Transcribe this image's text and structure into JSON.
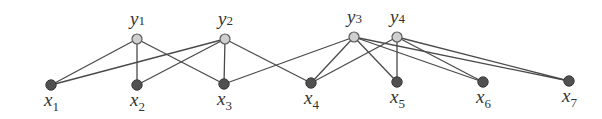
{
  "diagram": {
    "type": "bipartite-graph",
    "top_nodes": [
      {
        "id": "y1",
        "base": "y",
        "sub": "1",
        "x": 137,
        "y": 39
      },
      {
        "id": "y2",
        "base": "y",
        "sub": "2",
        "x": 225,
        "y": 39
      },
      {
        "id": "y3",
        "base": "y",
        "sub": "3",
        "x": 354,
        "y": 37
      },
      {
        "id": "y4",
        "base": "y",
        "sub": "4",
        "x": 397,
        "y": 37
      }
    ],
    "bottom_nodes": [
      {
        "id": "x1",
        "base": "x",
        "sub": "1",
        "x": 51,
        "y": 85
      },
      {
        "id": "x2",
        "base": "x",
        "sub": "2",
        "x": 137,
        "y": 85
      },
      {
        "id": "x3",
        "base": "x",
        "sub": "3",
        "x": 224,
        "y": 84
      },
      {
        "id": "x4",
        "base": "x",
        "sub": "4",
        "x": 311,
        "y": 83
      },
      {
        "id": "x5",
        "base": "x",
        "sub": "5",
        "x": 397,
        "y": 82
      },
      {
        "id": "x6",
        "base": "x",
        "sub": "6",
        "x": 483,
        "y": 82
      },
      {
        "id": "x7",
        "base": "x",
        "sub": "7",
        "x": 569,
        "y": 81
      }
    ],
    "edges": [
      [
        "y1",
        "x1"
      ],
      [
        "y1",
        "x2"
      ],
      [
        "y1",
        "x3"
      ],
      [
        "y2",
        "x1"
      ],
      [
        "y2",
        "x2"
      ],
      [
        "y2",
        "x3"
      ],
      [
        "y2",
        "x4"
      ],
      [
        "y3",
        "x3"
      ],
      [
        "y3",
        "x4"
      ],
      [
        "y3",
        "x5"
      ],
      [
        "y3",
        "x6"
      ],
      [
        "y3",
        "x7"
      ],
      [
        "y4",
        "x4"
      ],
      [
        "y4",
        "x5"
      ],
      [
        "y4",
        "x6"
      ],
      [
        "y4",
        "x7"
      ]
    ],
    "colors": {
      "top_node_fill": "#cfcfcf",
      "bottom_node_fill": "#505050",
      "edge": "#4a4a4a"
    }
  }
}
